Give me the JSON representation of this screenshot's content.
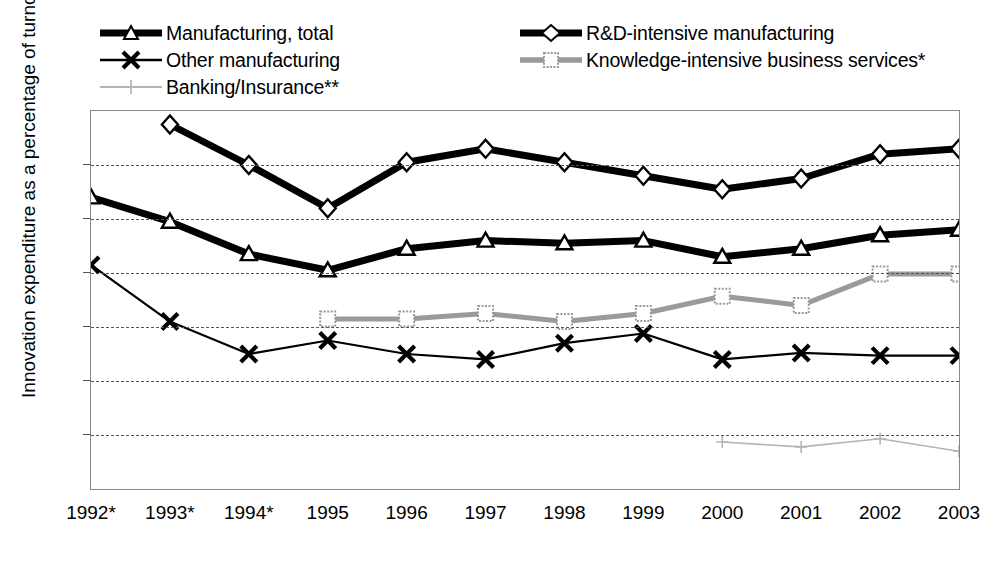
{
  "chart_data": {
    "type": "line",
    "title": "",
    "xlabel": "",
    "ylabel": "Innovation expenditure as a percentage of turnover",
    "ylim": [
      0,
      7
    ],
    "yticks": [
      0,
      1,
      2,
      3,
      4,
      5,
      6,
      7
    ],
    "grid": true,
    "legend_position": "top",
    "categories": [
      "1992*",
      "1993*",
      "1994*",
      "1995",
      "1996",
      "1997",
      "1998",
      "1999",
      "2000",
      "2001",
      "2002",
      "2003"
    ],
    "series": [
      {
        "name": "Manufacturing, total",
        "marker": "triangle",
        "color": "#000000",
        "width": 7,
        "values": [
          5.4,
          4.95,
          4.35,
          4.05,
          4.45,
          4.6,
          4.55,
          4.6,
          4.3,
          4.45,
          4.7,
          4.8
        ]
      },
      {
        "name": "R&D-intensive manufacturing",
        "marker": "diamond",
        "color": "#000000",
        "width": 7,
        "values": [
          null,
          6.75,
          6.0,
          5.2,
          6.05,
          6.3,
          6.05,
          5.8,
          5.55,
          5.75,
          6.2,
          6.3
        ]
      },
      {
        "name": "Other manufacturing",
        "marker": "x",
        "color": "#000000",
        "width": 2.2,
        "values": [
          4.15,
          3.1,
          2.5,
          2.75,
          2.5,
          2.4,
          2.7,
          2.88,
          2.4,
          2.52,
          2.47,
          2.47
        ]
      },
      {
        "name": "Knowledge-intensive business services*",
        "marker": "square",
        "color": "#9a9a9a",
        "width": 5,
        "values": [
          null,
          null,
          null,
          3.15,
          3.15,
          3.25,
          3.1,
          3.25,
          3.57,
          3.4,
          3.98,
          3.98
        ]
      },
      {
        "name": "Banking/Insurance**",
        "marker": "plus",
        "color": "#b5b5b5",
        "width": 1.6,
        "values": [
          null,
          null,
          null,
          null,
          null,
          null,
          null,
          null,
          0.87,
          0.78,
          0.93,
          0.7
        ]
      }
    ]
  },
  "axis": {
    "y_tick_labels": [
      "7",
      "6",
      "5",
      "4",
      "3",
      "2",
      "1",
      "0"
    ],
    "y_axis_title": "Innovation expenditure as a percentage of turnover",
    "x_tick_labels": [
      "1992*",
      "1993*",
      "1994*",
      "1995",
      "1996",
      "1997",
      "1998",
      "1999",
      "2000",
      "2001",
      "2002",
      "2003"
    ]
  },
  "legend": {
    "entries": [
      {
        "label": "Manufacturing, total",
        "key": "thick-line-triangle-marker"
      },
      {
        "label": "R&D-intensive manufacturing",
        "key": "thick-line-diamond-marker"
      },
      {
        "label": "Other manufacturing",
        "key": "thin-line-x-marker"
      },
      {
        "label": "Knowledge-intensive business services*",
        "key": "gray-line-square-marker"
      },
      {
        "label": "Banking/Insurance**",
        "key": "light-gray-line-plus-marker"
      }
    ]
  },
  "colors": {
    "primary": "#000000",
    "kibs_gray": "#9a9a9a",
    "banking_gray": "#b5b5b5",
    "gridline": "#555555",
    "plot_border": "#888888"
  }
}
